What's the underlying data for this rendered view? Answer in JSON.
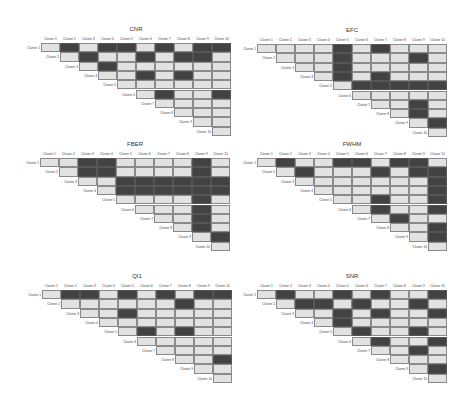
{
  "chart_data": [
    {
      "type": "heatmap",
      "title": "CNR",
      "labels": [
        "Cluster 1",
        "Cluster 2",
        "Cluster 3",
        "Cluster 4",
        "Cluster 5",
        "Cluster 6",
        "Cluster 7",
        "Cluster 8",
        "Cluster 9",
        "Cluster 10"
      ],
      "description": "Upper-triangular pairwise significance matrix; 1 = dark (significant), 0 = light",
      "matrix": [
        [
          0,
          1,
          0,
          1,
          1,
          0,
          1,
          0,
          1,
          1
        ],
        [
          null,
          0,
          1,
          0,
          0,
          1,
          0,
          1,
          1,
          0
        ],
        [
          null,
          null,
          0,
          1,
          0,
          0,
          0,
          0,
          0,
          0
        ],
        [
          null,
          null,
          null,
          0,
          0,
          1,
          0,
          1,
          0,
          0
        ],
        [
          null,
          null,
          null,
          null,
          0,
          0,
          0,
          0,
          0,
          0
        ],
        [
          null,
          null,
          null,
          null,
          null,
          0,
          1,
          0,
          0,
          1
        ],
        [
          null,
          null,
          null,
          null,
          null,
          null,
          0,
          0,
          0,
          0
        ],
        [
          null,
          null,
          null,
          null,
          null,
          null,
          null,
          0,
          0,
          0
        ],
        [
          null,
          null,
          null,
          null,
          null,
          null,
          null,
          null,
          0,
          0
        ],
        [
          null,
          null,
          null,
          null,
          null,
          null,
          null,
          null,
          null,
          0
        ]
      ]
    },
    {
      "type": "heatmap",
      "title": "EFC",
      "labels": [
        "Cluster 1",
        "Cluster 2",
        "Cluster 3",
        "Cluster 4",
        "Cluster 5",
        "Cluster 6",
        "Cluster 7",
        "Cluster 8",
        "Cluster 9",
        "Cluster 10"
      ],
      "matrix": [
        [
          0,
          0,
          0,
          0,
          1,
          0,
          1,
          0,
          0,
          0
        ],
        [
          null,
          0,
          0,
          0,
          1,
          0,
          0,
          0,
          1,
          0
        ],
        [
          null,
          null,
          0,
          0,
          1,
          0,
          0,
          0,
          0,
          0
        ],
        [
          null,
          null,
          null,
          0,
          1,
          0,
          1,
          0,
          0,
          0
        ],
        [
          null,
          null,
          null,
          null,
          0,
          1,
          1,
          1,
          1,
          1
        ],
        [
          null,
          null,
          null,
          null,
          null,
          0,
          0,
          0,
          0,
          0
        ],
        [
          null,
          null,
          null,
          null,
          null,
          null,
          0,
          0,
          1,
          0
        ],
        [
          null,
          null,
          null,
          null,
          null,
          null,
          null,
          0,
          1,
          0
        ],
        [
          null,
          null,
          null,
          null,
          null,
          null,
          null,
          null,
          0,
          1
        ],
        [
          null,
          null,
          null,
          null,
          null,
          null,
          null,
          null,
          null,
          0
        ]
      ]
    },
    {
      "type": "heatmap",
      "title": "FBER",
      "labels": [
        "Cluster 1",
        "Cluster 2",
        "Cluster 3",
        "Cluster 4",
        "Cluster 5",
        "Cluster 6",
        "Cluster 7",
        "Cluster 8",
        "Cluster 9",
        "Cluster 10"
      ],
      "matrix": [
        [
          0,
          0,
          1,
          1,
          0,
          0,
          0,
          0,
          1,
          0
        ],
        [
          null,
          0,
          1,
          1,
          0,
          0,
          0,
          0,
          1,
          0
        ],
        [
          null,
          null,
          0,
          0,
          1,
          1,
          1,
          1,
          1,
          1
        ],
        [
          null,
          null,
          null,
          0,
          1,
          1,
          1,
          1,
          1,
          1
        ],
        [
          null,
          null,
          null,
          null,
          0,
          0,
          0,
          0,
          1,
          0
        ],
        [
          null,
          null,
          null,
          null,
          null,
          0,
          0,
          0,
          1,
          0
        ],
        [
          null,
          null,
          null,
          null,
          null,
          null,
          0,
          0,
          1,
          0
        ],
        [
          null,
          null,
          null,
          null,
          null,
          null,
          null,
          0,
          1,
          0
        ],
        [
          null,
          null,
          null,
          null,
          null,
          null,
          null,
          null,
          0,
          1
        ],
        [
          null,
          null,
          null,
          null,
          null,
          null,
          null,
          null,
          null,
          0
        ]
      ]
    },
    {
      "type": "heatmap",
      "title": "FWHM",
      "labels": [
        "Cluster 1",
        "Cluster 2",
        "Cluster 3",
        "Cluster 4",
        "Cluster 5",
        "Cluster 6",
        "Cluster 7",
        "Cluster 8",
        "Cluster 9",
        "Cluster 10"
      ],
      "matrix": [
        [
          0,
          1,
          0,
          0,
          1,
          1,
          0,
          1,
          1,
          0
        ],
        [
          null,
          0,
          1,
          0,
          0,
          0,
          1,
          0,
          1,
          1
        ],
        [
          null,
          null,
          0,
          0,
          0,
          0,
          0,
          0,
          0,
          1
        ],
        [
          null,
          null,
          null,
          0,
          0,
          0,
          0,
          0,
          0,
          1
        ],
        [
          null,
          null,
          null,
          null,
          0,
          0,
          1,
          0,
          0,
          1
        ],
        [
          null,
          null,
          null,
          null,
          null,
          0,
          1,
          0,
          0,
          1
        ],
        [
          null,
          null,
          null,
          null,
          null,
          null,
          0,
          1,
          0,
          0
        ],
        [
          null,
          null,
          null,
          null,
          null,
          null,
          null,
          0,
          0,
          1
        ],
        [
          null,
          null,
          null,
          null,
          null,
          null,
          null,
          null,
          0,
          1
        ],
        [
          null,
          null,
          null,
          null,
          null,
          null,
          null,
          null,
          null,
          0
        ]
      ]
    },
    {
      "type": "heatmap",
      "title": "QI1",
      "labels": [
        "Cluster 1",
        "Cluster 2",
        "Cluster 3",
        "Cluster 4",
        "Cluster 5",
        "Cluster 6",
        "Cluster 7",
        "Cluster 8",
        "Cluster 9",
        "Cluster 10"
      ],
      "matrix": [
        [
          0,
          1,
          1,
          0,
          1,
          0,
          1,
          0,
          1,
          1
        ],
        [
          null,
          0,
          0,
          0,
          0,
          0,
          0,
          1,
          0,
          0
        ],
        [
          null,
          null,
          0,
          0,
          1,
          0,
          0,
          0,
          0,
          0
        ],
        [
          null,
          null,
          null,
          0,
          0,
          0,
          0,
          0,
          0,
          0
        ],
        [
          null,
          null,
          null,
          null,
          0,
          1,
          0,
          1,
          0,
          0
        ],
        [
          null,
          null,
          null,
          null,
          null,
          0,
          0,
          0,
          0,
          0
        ],
        [
          null,
          null,
          null,
          null,
          null,
          null,
          0,
          0,
          0,
          0
        ],
        [
          null,
          null,
          null,
          null,
          null,
          null,
          null,
          0,
          0,
          1
        ],
        [
          null,
          null,
          null,
          null,
          null,
          null,
          null,
          null,
          0,
          0
        ],
        [
          null,
          null,
          null,
          null,
          null,
          null,
          null,
          null,
          null,
          0
        ]
      ]
    },
    {
      "type": "heatmap",
      "title": "SNR",
      "labels": [
        "Cluster 1",
        "Cluster 2",
        "Cluster 3",
        "Cluster 4",
        "Cluster 5",
        "Cluster 6",
        "Cluster 7",
        "Cluster 8",
        "Cluster 9",
        "Cluster 10"
      ],
      "matrix": [
        [
          0,
          1,
          0,
          0,
          1,
          0,
          1,
          0,
          0,
          1
        ],
        [
          null,
          0,
          1,
          1,
          0,
          1,
          0,
          0,
          1,
          0
        ],
        [
          null,
          null,
          0,
          0,
          1,
          0,
          1,
          0,
          0,
          1
        ],
        [
          null,
          null,
          null,
          0,
          1,
          0,
          0,
          0,
          0,
          0
        ],
        [
          null,
          null,
          null,
          null,
          0,
          1,
          0,
          0,
          1,
          0
        ],
        [
          null,
          null,
          null,
          null,
          null,
          0,
          1,
          0,
          0,
          1
        ],
        [
          null,
          null,
          null,
          null,
          null,
          null,
          0,
          0,
          1,
          0
        ],
        [
          null,
          null,
          null,
          null,
          null,
          null,
          null,
          0,
          0,
          0
        ],
        [
          null,
          null,
          null,
          null,
          null,
          null,
          null,
          null,
          0,
          1
        ],
        [
          null,
          null,
          null,
          null,
          null,
          null,
          null,
          null,
          null,
          0
        ]
      ]
    }
  ],
  "colors": {
    "significant": "#424242",
    "not_significant": "#e2e2e2",
    "border": "#8a8a8a"
  },
  "layout": {
    "panels": [
      {
        "x": 41,
        "y": 43
      },
      {
        "x": 257,
        "y": 44
      },
      {
        "x": 40,
        "y": 158
      },
      {
        "x": 257,
        "y": 158
      },
      {
        "x": 42,
        "y": 290
      },
      {
        "x": 257,
        "y": 290
      }
    ]
  }
}
